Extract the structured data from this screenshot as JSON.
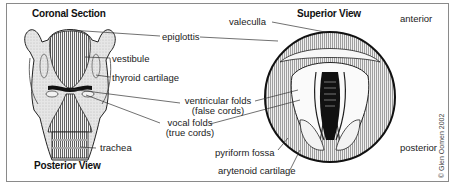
{
  "diagram": {
    "left_panel": {
      "title": "Coronal Section",
      "subtitle": "Posterior View"
    },
    "right_panel": {
      "title": "Superior View",
      "orientation": {
        "top": "anterior",
        "bottom": "posterior"
      }
    },
    "labels": {
      "valeculla": "valeculla",
      "epiglottis": "epiglottis",
      "vestibule": "vestibule",
      "thyroid_cartilage": "thyroid cartilage",
      "ventricular_folds_line1": "ventricular folds",
      "ventricular_folds_line2": "(false cords)",
      "vocal_folds_line1": "vocal folds",
      "vocal_folds_line2": "(true cords)",
      "trachea": "trachea",
      "pyriform_fossa": "pyriform fossa",
      "arytenoid_cartilage": "arytenoid cartilage"
    },
    "copyright": "© Glen Oomen 2002",
    "colors": {
      "border": "#8a8a8a",
      "ink": "#1a1a1a",
      "tissue_fill": "#e4e4e4",
      "background": "#ffffff"
    }
  }
}
